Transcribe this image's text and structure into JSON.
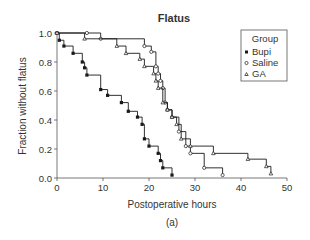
{
  "chart_data": {
    "type": "line",
    "subtype": "kaplan-meier step",
    "title": "Flatus",
    "xlabel": "Postoperative hours",
    "ylabel": "Fraction without flatus",
    "caption": "(a)",
    "xlim": [
      0,
      50
    ],
    "ylim": [
      0,
      1.0
    ],
    "xticks": [
      "0",
      "10",
      "20",
      "30",
      "40",
      "50"
    ],
    "yticks": [
      "0.0",
      "0.2",
      "0.4",
      "0.6",
      "0.8",
      "1.0"
    ],
    "grid": false,
    "legend": {
      "title": "Group",
      "position": "upper right",
      "entries": [
        "Bupi",
        "Saline",
        "GA"
      ]
    },
    "series": [
      {
        "name": "Bupi",
        "marker": "filled-square",
        "x": [
          0,
          0.5,
          1.5,
          3.5,
          5.5,
          6,
          6.5,
          9.5,
          11,
          14,
          15.5,
          17.5,
          18.5,
          19,
          20,
          22,
          22.5,
          23,
          25
        ],
        "y": [
          1.0,
          0.95,
          0.91,
          0.86,
          0.8,
          0.76,
          0.71,
          0.61,
          0.57,
          0.52,
          0.46,
          0.42,
          0.37,
          0.27,
          0.22,
          0.17,
          0.12,
          0.07,
          0.02
        ]
      },
      {
        "name": "Saline",
        "marker": "open-circle",
        "x": [
          0,
          6.5,
          9.5,
          19,
          20.5,
          21.5,
          22,
          22.5,
          23,
          23.5,
          24,
          25,
          26.5,
          28,
          29,
          32,
          36
        ],
        "y": [
          1.0,
          1.0,
          0.96,
          0.91,
          0.87,
          0.77,
          0.72,
          0.67,
          0.62,
          0.52,
          0.47,
          0.42,
          0.32,
          0.22,
          0.17,
          0.07,
          0.02
        ]
      },
      {
        "name": "GA",
        "marker": "open-triangle",
        "x": [
          0,
          6,
          13,
          15,
          18,
          19,
          21,
          21.5,
          22,
          23,
          24,
          25,
          26,
          27,
          29,
          34,
          41.5,
          45.5,
          46.5
        ],
        "y": [
          1.0,
          0.96,
          0.91,
          0.86,
          0.82,
          0.77,
          0.72,
          0.67,
          0.62,
          0.52,
          0.47,
          0.42,
          0.37,
          0.27,
          0.22,
          0.17,
          0.13,
          0.08,
          0.03
        ]
      }
    ]
  },
  "colors": {
    "line": "#1a1a1a",
    "text": "#333333",
    "axis": "#555555"
  }
}
